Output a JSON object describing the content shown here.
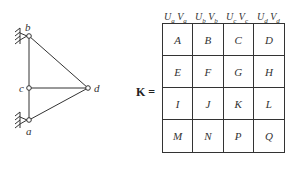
{
  "truss": {
    "nodes": [
      {
        "id": "b",
        "label": "b"
      },
      {
        "id": "c",
        "label": "c"
      },
      {
        "id": "a",
        "label": "a"
      },
      {
        "id": "d",
        "label": "d"
      }
    ],
    "supports": [
      "a",
      "b"
    ]
  },
  "matrix": {
    "label": "K =",
    "column_headers": [
      {
        "u": "U",
        "u_sub": "a",
        "v": "V",
        "v_sub": "a"
      },
      {
        "u": "U",
        "u_sub": "b",
        "v": "V",
        "v_sub": "b"
      },
      {
        "u": "U",
        "u_sub": "c",
        "v": "V",
        "v_sub": "c"
      },
      {
        "u": "U",
        "u_sub": "d",
        "v": "V",
        "v_sub": "d"
      }
    ],
    "cells": [
      "A",
      "B",
      "C",
      "D",
      "E",
      "F",
      "G",
      "H",
      "I",
      "J",
      "K",
      "L",
      "M",
      "N",
      "P",
      "Q"
    ]
  }
}
